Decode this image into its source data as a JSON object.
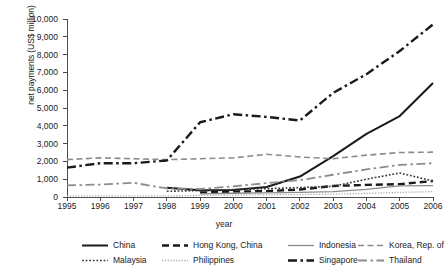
{
  "chart_data": {
    "type": "line",
    "title": "",
    "xlabel": "year",
    "ylabel": "net payments (US$ million)",
    "x": [
      1995,
      1996,
      1997,
      1998,
      1999,
      2000,
      2001,
      2002,
      2003,
      2004,
      2005,
      2006
    ],
    "xlim": [
      1995,
      2006
    ],
    "ylim": [
      0,
      10000
    ],
    "yticks": [
      0,
      1000,
      2000,
      3000,
      4000,
      5000,
      6000,
      7000,
      8000,
      9000,
      10000
    ],
    "ytick_labels": [
      "0",
      "1,000",
      "2,000",
      "3,000",
      "4,000",
      "5,000",
      "6,000",
      "7,000",
      "8,000",
      "9,000",
      "10,000"
    ],
    "xtick_labels": [
      "1995",
      "1996",
      "1997",
      "1998",
      "1999",
      "2000",
      "2001",
      "2002",
      "2003",
      "2004",
      "2005",
      "2006"
    ],
    "grid": false,
    "legend_position": "bottom",
    "series": [
      {
        "name": "China",
        "color": "#1a1a1a",
        "width": 2.0,
        "dash": "none",
        "values": [
          null,
          null,
          null,
          520,
          380,
          400,
          560,
          1150,
          2300,
          3550,
          4550,
          6400
        ]
      },
      {
        "name": "Hong Kong, China",
        "color": "#1a1a1a",
        "width": 2.4,
        "dash": "7,4",
        "values": [
          null,
          null,
          null,
          null,
          250,
          300,
          330,
          420,
          620,
          680,
          720,
          900
        ]
      },
      {
        "name": "Indonesia",
        "color": "#8c8c8c",
        "width": 1.3,
        "dash": "none",
        "values": [
          null,
          null,
          null,
          null,
          180,
          210,
          230,
          260,
          300,
          430,
          620,
          640
        ]
      },
      {
        "name": "Korea, Rep. of",
        "color": "#8c8c8c",
        "width": 1.6,
        "dash": "6,3.5",
        "values": [
          2100,
          2200,
          2150,
          2100,
          2150,
          2200,
          2400,
          2250,
          2150,
          2350,
          2500,
          2520
        ]
      },
      {
        "name": "Malaysia",
        "color": "#3a3a3a",
        "width": 1.6,
        "dash": "1.8,1.8",
        "values": [
          null,
          null,
          null,
          320,
          360,
          420,
          470,
          530,
          600,
          1000,
          1350,
          900
        ]
      },
      {
        "name": "Philippines",
        "color": "#a6a6a6",
        "width": 1.3,
        "dash": "1.2,1.6",
        "values": [
          60,
          60,
          60,
          60,
          90,
          110,
          120,
          140,
          160,
          200,
          260,
          300
        ]
      },
      {
        "name": "Singapore",
        "color": "#1a1a1a",
        "width": 2.4,
        "dash": "9,3.5,2.5,3.5",
        "values": [
          1650,
          1900,
          1900,
          2050,
          4200,
          4650,
          4500,
          4300,
          5850,
          6900,
          8200,
          9700
        ]
      },
      {
        "name": "Thailand",
        "color": "#8c8c8c",
        "width": 1.8,
        "dash": "9,3.5,2.5,3.5",
        "values": [
          650,
          700,
          800,
          480,
          450,
          600,
          780,
          950,
          1250,
          1550,
          1800,
          1900
        ]
      }
    ]
  },
  "legend": {
    "items": [
      {
        "label": "China",
        "series": 0
      },
      {
        "label": "Hong Kong, China",
        "series": 1
      },
      {
        "label": "Indonesia",
        "series": 2
      },
      {
        "label": "Korea, Rep. of",
        "series": 3
      },
      {
        "label": "Malaysia",
        "series": 4
      },
      {
        "label": "Philippines",
        "series": 5
      },
      {
        "label": "Singapore",
        "series": 6
      },
      {
        "label": "Thailand",
        "series": 7
      }
    ]
  },
  "colors": {
    "axis": "#4d4d4d",
    "text": "#1a1a1a",
    "background": "#ffffff"
  }
}
